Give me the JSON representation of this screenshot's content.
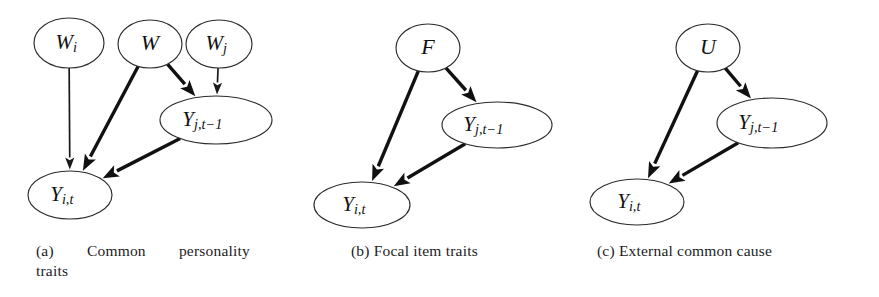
{
  "figure": {
    "background_color": "#ffffff",
    "node_stroke_color": "#2b2b2b",
    "edge_color": "#111111",
    "panel_count": 3
  },
  "panels": [
    {
      "id": "a",
      "tag": "(a)",
      "caption_line1": "Common  personality",
      "caption_line2": "traits",
      "caption_full": "(a) Common personality traits",
      "nodes": [
        {
          "id": "Wi",
          "base": "W",
          "sub": "i",
          "shape": "ellipse",
          "cx": 69,
          "cy": 43,
          "rx": 35,
          "ry": 25
        },
        {
          "id": "W",
          "base": "W",
          "sub": "",
          "shape": "ellipse",
          "cx": 150,
          "cy": 44,
          "rx": 32,
          "ry": 24
        },
        {
          "id": "Wj",
          "base": "W",
          "sub": "j",
          "shape": "ellipse",
          "cx": 219,
          "cy": 44,
          "rx": 33,
          "ry": 24
        },
        {
          "id": "Yjt1",
          "base": "Y",
          "sub": "j,t−1",
          "shape": "ellipse",
          "cx": 216,
          "cy": 120,
          "rx": 56,
          "ry": 24
        },
        {
          "id": "Yit",
          "base": "Y",
          "sub": "i,t",
          "shape": "ellipse",
          "cx": 70,
          "cy": 195,
          "rx": 42,
          "ry": 24
        }
      ],
      "edges": [
        {
          "from": "Wi",
          "to": "Yit",
          "weight": "thin"
        },
        {
          "from": "W",
          "to": "Yit",
          "weight": "thick"
        },
        {
          "from": "W",
          "to": "Yjt1",
          "weight": "thick"
        },
        {
          "from": "Wj",
          "to": "Yjt1",
          "weight": "thin"
        },
        {
          "from": "Yjt1",
          "to": "Yit",
          "weight": "thick"
        }
      ]
    },
    {
      "id": "b",
      "tag": "(b)",
      "caption_line1": "Focal item traits",
      "caption_line2": "",
      "caption_full": "(b) Focal item traits",
      "nodes": [
        {
          "id": "F",
          "base": "F",
          "sub": "",
          "shape": "circle",
          "cx": 428,
          "cy": 48,
          "rx": 32,
          "ry": 24
        },
        {
          "id": "Yjt1",
          "base": "Y",
          "sub": "j,t−1",
          "shape": "ellipse",
          "cx": 497,
          "cy": 125,
          "rx": 55,
          "ry": 23
        },
        {
          "id": "Yit",
          "base": "Y",
          "sub": "i,t",
          "shape": "ellipse",
          "cx": 362,
          "cy": 205,
          "rx": 48,
          "ry": 23
        }
      ],
      "edges": [
        {
          "from": "F",
          "to": "Yjt1",
          "weight": "thick"
        },
        {
          "from": "F",
          "to": "Yit",
          "weight": "thick"
        },
        {
          "from": "Yjt1",
          "to": "Yit",
          "weight": "thick"
        }
      ]
    },
    {
      "id": "c",
      "tag": "(c)",
      "caption_line1": "External common cause",
      "caption_line2": "",
      "caption_full": "(c) External common cause",
      "nodes": [
        {
          "id": "U",
          "base": "U",
          "sub": "",
          "shape": "circle",
          "cx": 708,
          "cy": 48,
          "rx": 32,
          "ry": 24
        },
        {
          "id": "Yjt1",
          "base": "Y",
          "sub": "j,t−1",
          "shape": "ellipse",
          "cx": 772,
          "cy": 123,
          "rx": 55,
          "ry": 25
        },
        {
          "id": "Yit",
          "base": "Y",
          "sub": "i,t",
          "shape": "ellipse",
          "cx": 637,
          "cy": 202,
          "rx": 47,
          "ry": 23
        }
      ],
      "edges": [
        {
          "from": "U",
          "to": "Yjt1",
          "weight": "thick"
        },
        {
          "from": "U",
          "to": "Yit",
          "weight": "thick"
        },
        {
          "from": "Yjt1",
          "to": "Yit",
          "weight": "thick"
        }
      ]
    }
  ]
}
